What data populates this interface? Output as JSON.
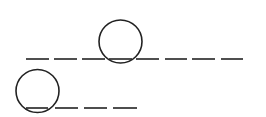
{
  "diagram": {
    "stroke_color": "#222222",
    "background": "#ffffff",
    "rows": [
      {
        "name": "word-row-1",
        "y": 59,
        "dashes": [
          {
            "x1": 26,
            "x2": 49
          },
          {
            "x1": 54,
            "x2": 77
          },
          {
            "x1": 82,
            "x2": 105
          },
          {
            "x1": 109,
            "x2": 132
          },
          {
            "x1": 136,
            "x2": 159
          },
          {
            "x1": 165,
            "x2": 187
          },
          {
            "x1": 192,
            "x2": 215
          },
          {
            "x1": 221,
            "x2": 243
          }
        ],
        "circle": {
          "cx": 120.5,
          "cy": 41.5,
          "r": 21.5,
          "around_dash_index": 3
        }
      },
      {
        "name": "word-row-2",
        "y": 108,
        "dashes": [
          {
            "x1": 26,
            "x2": 48
          },
          {
            "x1": 55,
            "x2": 78
          },
          {
            "x1": 84,
            "x2": 107
          },
          {
            "x1": 113,
            "x2": 137
          }
        ],
        "circle": {
          "cx": 37.5,
          "cy": 91,
          "r": 21.5,
          "around_dash_index": 0
        }
      }
    ]
  }
}
